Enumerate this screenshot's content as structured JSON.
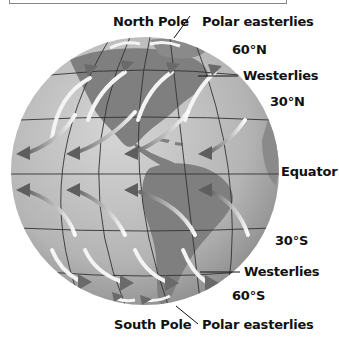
{
  "diagram": {
    "labels": {
      "north_pole": "North Pole",
      "polar_easterlies_north": "Polar easterlies",
      "lat_60n": "60°N",
      "westerlies_north": "Westerlies",
      "lat_30n": "30°N",
      "equator": "Equator",
      "lat_30s": "30°S",
      "westerlies_south": "Westerlies",
      "lat_60s": "60°S",
      "south_pole": "South Pole",
      "polar_easterlies_south": "Polar easterlies"
    },
    "colors": {
      "ocean": "#bdbdbd",
      "land": "#7d7d7d",
      "grid": "#333333",
      "arrow": "#f2f2f2",
      "arrow_head": "#6e6e6e"
    }
  }
}
